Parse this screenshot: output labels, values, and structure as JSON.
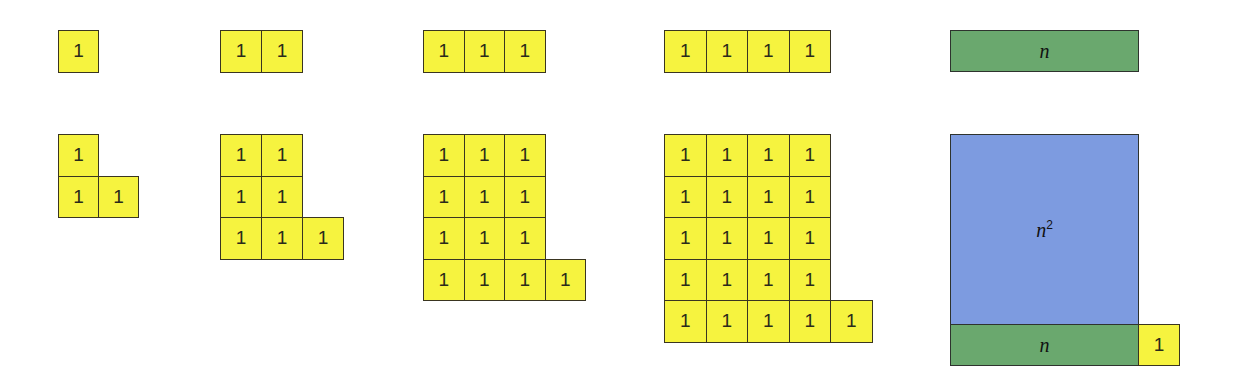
{
  "colors": {
    "unit": "#f6f33f",
    "bar": "#6aa86e",
    "square": "#7d9be0",
    "border": "#3a3520"
  },
  "unit_label": "1",
  "columns": [
    {
      "x": 58,
      "cell_w": 40,
      "top_count": 1,
      "rows": 1
    },
    {
      "x": 220,
      "cell_w": 41,
      "top_count": 2,
      "rows": 2
    },
    {
      "x": 423,
      "cell_w": 40.5,
      "top_count": 3,
      "rows": 3
    },
    {
      "x": 664,
      "cell_w": 41.5,
      "top_count": 4,
      "rows": 4
    }
  ],
  "general": {
    "top_bar_label": "n",
    "square_label_base": "n",
    "square_label_exp": "2",
    "bottom_bar_label": "n",
    "corner_unit_label": "1"
  }
}
